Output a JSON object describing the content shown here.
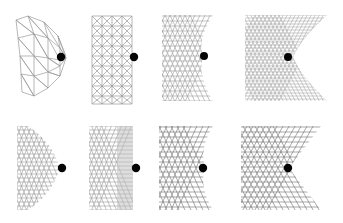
{
  "figure": {
    "background_color": "#ffffff",
    "mesh_color": "#9a9a9a",
    "mesh_color_dark": "#6e6e6e",
    "marker_color": "#050505",
    "shade_color": "#a8a8a8",
    "rows": 2,
    "columns": 4,
    "width": 343,
    "height": 223
  },
  "chart_data": {
    "type": "diagram-grid",
    "xlabel": "",
    "ylabel": "",
    "grid": false,
    "legend": "none",
    "panel_count": 8,
    "panels": [
      {
        "index": 1,
        "row": 1,
        "column": 1,
        "label": "",
        "mesh_type": "triangular-lattice",
        "mesh_density": "coarse",
        "columns_n": 5,
        "rows_n": 7,
        "right_edge_shape": "convex-point",
        "shaded_region": false,
        "marker": {
          "shape": "circle",
          "x": 61,
          "y": 57,
          "radius": 4.2,
          "color": "#050505"
        },
        "bounds": {
          "x": 14,
          "y": 14,
          "width": 62,
          "height": 86
        }
      },
      {
        "index": 2,
        "row": 1,
        "column": 2,
        "label": "",
        "mesh_type": "triangular-lattice",
        "mesh_density": "coarse",
        "columns_n": 6,
        "rows_n": 9,
        "right_edge_shape": "straight",
        "shaded_region": false,
        "marker": {
          "shape": "circle",
          "x": 134,
          "y": 57,
          "radius": 4.2,
          "color": "#050505"
        },
        "bounds": {
          "x": 92,
          "y": 14,
          "width": 40,
          "height": 88
        }
      },
      {
        "index": 3,
        "row": 1,
        "column": 3,
        "label": "",
        "mesh_type": "triangular-lattice",
        "mesh_density": "fine",
        "columns_n": 14,
        "rows_n": 18,
        "right_edge_shape": "concave-notch",
        "shaded_region": false,
        "marker": {
          "shape": "circle",
          "x": 205,
          "y": 56,
          "radius": 4.0,
          "color": "#050505"
        },
        "bounds": {
          "x": 162,
          "y": 14,
          "width": 62,
          "height": 88
        }
      },
      {
        "index": 4,
        "row": 1,
        "column": 4,
        "label": "",
        "mesh_type": "triangular-lattice",
        "mesh_density": "very-fine",
        "columns_n": 22,
        "rows_n": 26,
        "right_edge_shape": "concave-notch",
        "shaded_region": true,
        "shade_label": "cusp-shaded-region",
        "marker": {
          "shape": "circle",
          "x": 288,
          "y": 57,
          "radius": 4.0,
          "color": "#050505"
        },
        "bounds": {
          "x": 246,
          "y": 14,
          "width": 84,
          "height": 88
        }
      },
      {
        "index": 5,
        "row": 2,
        "column": 1,
        "label": "",
        "mesh_type": "triangular-lattice",
        "mesh_density": "fine",
        "columns_n": 12,
        "rows_n": 16,
        "right_edge_shape": "convex-point",
        "shaded_region": false,
        "marker": {
          "shape": "circle",
          "x": 62,
          "y": 168,
          "radius": 4.2,
          "color": "#050505"
        },
        "bounds": {
          "x": 16,
          "y": 126,
          "width": 60,
          "height": 84
        }
      },
      {
        "index": 6,
        "row": 2,
        "column": 2,
        "label": "",
        "mesh_type": "triangular-lattice",
        "mesh_density": "fine",
        "columns_n": 13,
        "rows_n": 17,
        "right_edge_shape": "straight",
        "shaded_region": true,
        "shade_label": "right-edge-band",
        "marker": {
          "shape": "circle",
          "x": 136,
          "y": 168,
          "radius": 4.2,
          "color": "#050505"
        },
        "bounds": {
          "x": 89,
          "y": 126,
          "width": 48,
          "height": 84
        }
      },
      {
        "index": 7,
        "row": 2,
        "column": 3,
        "label": "",
        "mesh_type": "triangular-lattice",
        "mesh_density": "fine",
        "columns_n": 14,
        "rows_n": 17,
        "right_edge_shape": "concave-notch",
        "shaded_region": false,
        "marker": {
          "shape": "circle",
          "x": 203,
          "y": 168,
          "radius": 4.2,
          "color": "#050505"
        },
        "bounds": {
          "x": 161,
          "y": 126,
          "width": 58,
          "height": 84
        }
      },
      {
        "index": 8,
        "row": 2,
        "column": 4,
        "label": "",
        "mesh_type": "triangular-lattice",
        "mesh_density": "fine",
        "columns_n": 16,
        "rows_n": 18,
        "right_edge_shape": "deep-v-notch",
        "shaded_region": false,
        "marker": {
          "shape": "circle",
          "x": 288,
          "y": 168,
          "radius": 4.2,
          "color": "#050505"
        },
        "bounds": {
          "x": 243,
          "y": 126,
          "width": 78,
          "height": 84
        }
      }
    ]
  }
}
